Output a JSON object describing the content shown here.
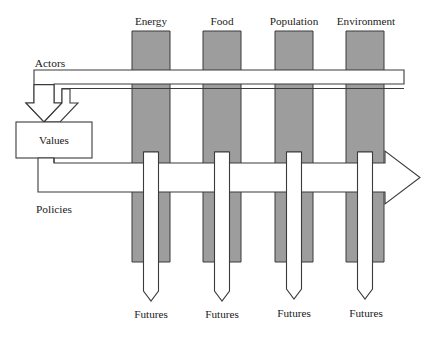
{
  "diagram": {
    "colors": {
      "column_fill": "#9d9d9d",
      "stroke": "#3b3b3b",
      "band_fill": "#ffffff",
      "background": "#ffffff"
    },
    "columns": [
      {
        "label": "Energy",
        "future_label": "Futures"
      },
      {
        "label": "Food",
        "future_label": "Futures"
      },
      {
        "label": "Population",
        "future_label": "Futures"
      },
      {
        "label": "Environment",
        "future_label": "Futures"
      }
    ],
    "bands": [
      {
        "label": "Actors",
        "direction": "right-to-left-into-values"
      },
      {
        "label": "Policies",
        "direction": "left-to-right-out"
      }
    ],
    "box": {
      "label": "Values"
    }
  }
}
